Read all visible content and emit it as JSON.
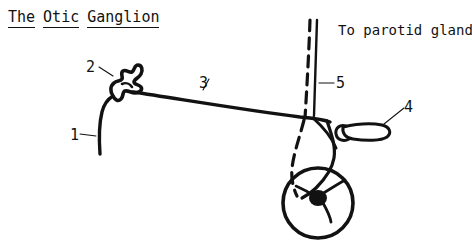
{
  "figure": {
    "title_words": [
      "The",
      "Otic",
      "Ganglion"
    ],
    "title_full": "The Otic Ganglion",
    "caption_right": "To parotid gland",
    "style": "black-and-white line drawing",
    "ink_color": "#121212",
    "background_color": "#ffffff"
  },
  "labels": [
    {
      "id": "1",
      "text": "1"
    },
    {
      "id": "2",
      "text": "2"
    },
    {
      "id": "3",
      "text": "3"
    },
    {
      "id": "4",
      "text": "4"
    },
    {
      "id": "5",
      "text": "5"
    }
  ]
}
